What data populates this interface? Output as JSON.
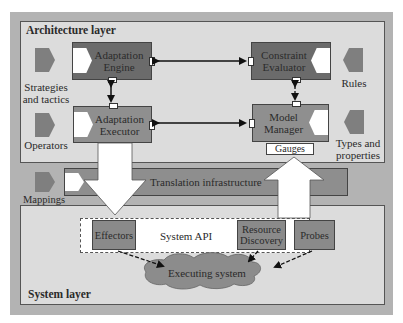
{
  "diagram": {
    "architecture_layer": {
      "title": "Architecture layer"
    },
    "system_layer": {
      "title": "System layer"
    },
    "components": {
      "adaptation_engine": {
        "label_line1": "Adaptation",
        "label_line2": "Engine"
      },
      "adaptation_executor": {
        "label_line1": "Adaptation",
        "label_line2": "Executor"
      },
      "constraint_evaluator": {
        "label_line1": "Constraint",
        "label_line2": "Evaluator"
      },
      "model_manager": {
        "label_line1": "Model",
        "label_line2": "Manager"
      },
      "gauges": {
        "label": "Gauges"
      }
    },
    "inputs": {
      "strategies": {
        "label_line1": "Strategies",
        "label_line2": "and tactics"
      },
      "operators": {
        "label": "Operators"
      },
      "rules": {
        "label": "Rules"
      },
      "types": {
        "label_line1": "Types and",
        "label_line2": "properties"
      },
      "mappings": {
        "label": "Mappings"
      }
    },
    "translation": {
      "label": "Translation infrastructure"
    },
    "system_api": {
      "label": "System API",
      "effectors": {
        "label": "Effectors"
      },
      "resource_discovery": {
        "label_line1": "Resource",
        "label_line2": "Discovery"
      },
      "probes": {
        "label": "Probes"
      }
    },
    "executing_system": {
      "label": "Executing system"
    },
    "colors": {
      "frame": "#b3b3b3",
      "layer_bg": "#dcdcdc",
      "dark_component": "#6b6b6b",
      "mid_component": "#8f8f8f",
      "translation_band": "#8e8e8e",
      "cloud": "#8c8c8c"
    }
  }
}
